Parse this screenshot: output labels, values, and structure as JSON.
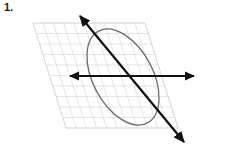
{
  "figure": {
    "problem_number": "1.",
    "background_color": "#ffffff"
  },
  "plane": {
    "name": "grid-plane",
    "shape": "parallelogram",
    "stroke_color": "#d4d4d4",
    "stroke_width": 0.6,
    "corners": [
      {
        "label": "top-left",
        "x": 33,
        "y": 23
      },
      {
        "label": "top-right",
        "x": 145,
        "y": 23
      },
      {
        "label": "bottom-right",
        "x": 178,
        "y": 128
      },
      {
        "label": "bottom-left",
        "x": 66,
        "y": 128
      }
    ],
    "columns": 11,
    "rows": 10,
    "shear_dx": 33
  },
  "ellipse": {
    "name": "ellipse-curve",
    "stroke_color": "#6b6b6b",
    "stroke_width": 1.3,
    "center_x": 123,
    "center_y": 77,
    "radius_x": 52,
    "radius_y": 30,
    "rotation_deg": 62,
    "fill": "none"
  },
  "horizontal_line": {
    "name": "horizontal-axis-line",
    "stroke_color": "#111111",
    "stroke_width": 2.0,
    "x1": 70,
    "y1": 76,
    "x2": 194,
    "y2": 76,
    "arrow_start": true,
    "arrow_end": true
  },
  "diagonal_line": {
    "name": "diagonal-axis-line",
    "stroke_color": "#111111",
    "stroke_width": 2.2,
    "x1": 80,
    "y1": 16,
    "x2": 184,
    "y2": 142,
    "arrow_start": true,
    "arrow_end": true
  },
  "arrowhead": {
    "color": "#111111",
    "length": 9,
    "width": 5
  }
}
